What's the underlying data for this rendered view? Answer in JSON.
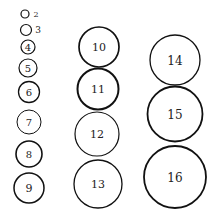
{
  "circles": [
    {
      "label": "2",
      "cx": 25,
      "cy": 14,
      "r": 4,
      "sw": 1.2,
      "fs": 8,
      "outside": true,
      "lx": 36,
      "ly": 14
    },
    {
      "label": "3",
      "cx": 26,
      "cy": 30,
      "r": 5.5,
      "sw": 1.2,
      "fs": 9,
      "outside": true,
      "lx": 38,
      "ly": 30
    },
    {
      "label": "4",
      "cx": 28,
      "cy": 47,
      "r": 7,
      "sw": 1.2,
      "fs": 10
    },
    {
      "label": "5",
      "cx": 28,
      "cy": 68,
      "r": 9,
      "sw": 1.2,
      "fs": 10
    },
    {
      "label": "6",
      "cx": 29,
      "cy": 92,
      "r": 10.5,
      "sw": 1.3,
      "fs": 10
    },
    {
      "label": "7",
      "cx": 29,
      "cy": 122,
      "r": 12,
      "sw": 1.0,
      "fs": 10
    },
    {
      "label": "8",
      "cx": 29,
      "cy": 154,
      "r": 13,
      "sw": 1.6,
      "fs": 10
    },
    {
      "label": "9",
      "cx": 29,
      "cy": 188,
      "r": 15,
      "sw": 1.5,
      "fs": 11
    },
    {
      "label": "10",
      "cx": 99,
      "cy": 47,
      "r": 20,
      "sw": 1.7,
      "fs": 11
    },
    {
      "label": "11",
      "cx": 98,
      "cy": 89,
      "r": 20.5,
      "sw": 2.0,
      "fs": 11
    },
    {
      "label": "12",
      "cx": 97,
      "cy": 134,
      "r": 22,
      "sw": 1.2,
      "fs": 11
    },
    {
      "label": "13",
      "cx": 98,
      "cy": 184,
      "r": 24,
      "sw": 1.3,
      "fs": 11
    },
    {
      "label": "14",
      "cx": 175,
      "cy": 60,
      "r": 25,
      "sw": 1.3,
      "fs": 12
    },
    {
      "label": "15",
      "cx": 175,
      "cy": 114,
      "r": 27.5,
      "sw": 1.8,
      "fs": 12
    },
    {
      "label": "16",
      "cx": 175,
      "cy": 177,
      "r": 31,
      "sw": 1.8,
      "fs": 12
    }
  ]
}
